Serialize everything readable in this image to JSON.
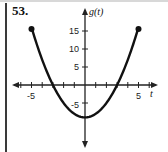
{
  "problem": {
    "number": "53."
  },
  "chart_data": {
    "type": "line",
    "title": "",
    "xlabel": "t",
    "ylabel": "g(t)",
    "xlim": [
      -7,
      7
    ],
    "ylim": [
      -14,
      19
    ],
    "x_ticks": [
      -6,
      -5,
      -4,
      -3,
      -2,
      -1,
      1,
      2,
      3,
      4,
      5,
      6
    ],
    "x_tick_labels": {
      "-5": "-5",
      "5": "5"
    },
    "y_tick_labels": [
      "15",
      "10",
      "5",
      "-5"
    ],
    "y_ticks": [
      15,
      10,
      5,
      -5
    ],
    "grid": false,
    "legend": null,
    "series": [
      {
        "name": "g(t)",
        "x": [
          -5,
          -4,
          -3,
          -2,
          -1,
          0,
          1,
          2,
          3,
          4,
          5
        ],
        "values": [
          16,
          7,
          0,
          -5,
          -8,
          -9,
          -8,
          -5,
          0,
          7,
          16
        ],
        "endpoints": "closed"
      }
    ],
    "annotations": [
      "closed dot at (-5, 16)",
      "closed dot at (5, 16)"
    ]
  },
  "labels": {
    "x_axis": "t",
    "y_axis": "g(t)",
    "tick_neg5": "-5",
    "tick_5": "5",
    "tick_15": "15",
    "tick_10": "10",
    "tick_y5": "5",
    "tick_yneg5": "-5"
  }
}
